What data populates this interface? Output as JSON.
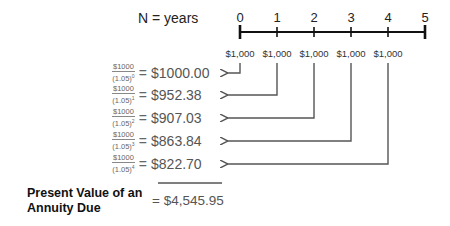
{
  "diagram": {
    "axis_label": "N = years",
    "ticks": [
      "0",
      "1",
      "2",
      "3",
      "4",
      "5"
    ],
    "cash_flows": [
      "$1,000",
      "$1,000",
      "$1,000",
      "$1,000",
      "$1,000"
    ],
    "rows": [
      {
        "numerator": "$1000",
        "denominator": "(1.05)",
        "exponent": "0",
        "equals": "=",
        "value": "$1000.00"
      },
      {
        "numerator": "$1000",
        "denominator": "(1.05)",
        "exponent": "1",
        "equals": "=",
        "value": "$952.38"
      },
      {
        "numerator": "$1000",
        "denominator": "(1.05)",
        "exponent": "2",
        "equals": "=",
        "value": "$907.03"
      },
      {
        "numerator": "$1000",
        "denominator": "(1.05)",
        "exponent": "3",
        "equals": "=",
        "value": "$863.84"
      },
      {
        "numerator": "$1000",
        "denominator": "(1.05)",
        "exponent": "4",
        "equals": "=",
        "value": "$822.70"
      }
    ],
    "total": {
      "label_line1": "Present Value of an",
      "label_line2": "Annuity Due",
      "value": "= $4,545.95"
    },
    "colors": {
      "timeline": "#111111",
      "arrows": "#555555",
      "text": "#555555"
    }
  }
}
